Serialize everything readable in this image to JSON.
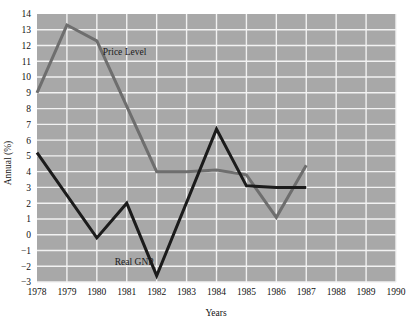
{
  "chart_data": {
    "type": "line",
    "title": "",
    "xlabel": "Years",
    "ylabel": "Annual (%)",
    "grid": true,
    "legend_position": "inline-annotation",
    "x": [
      1978,
      1979,
      1980,
      1981,
      1982,
      1983,
      1984,
      1985,
      1986,
      1987,
      1988,
      1989,
      1990
    ],
    "xlim": [
      1978,
      1990
    ],
    "ylim": [
      -3,
      14
    ],
    "xticks": [
      "1978",
      "1979",
      "1980",
      "1981",
      "1982",
      "1983",
      "1984",
      "1985",
      "1986",
      "1987",
      "1988",
      "1989",
      "1990"
    ],
    "yticks": [
      "14",
      "13",
      "12",
      "11",
      "10",
      "9",
      "8",
      "7",
      "6",
      "5",
      "4",
      "3",
      "2",
      "1",
      "0",
      "-1",
      "-2",
      "-3"
    ],
    "series": [
      {
        "name": "Price Level",
        "color": "#6e6e6e",
        "label_x": 1980.2,
        "label_y": 11.4,
        "x": [
          1978,
          1979,
          1980,
          1982,
          1983,
          1984,
          1985,
          1986,
          1987
        ],
        "values": [
          9.0,
          13.3,
          12.3,
          4.0,
          4.0,
          4.1,
          3.8,
          1.1,
          4.4
        ]
      },
      {
        "name": "Real GNP",
        "color": "#1b1b1b",
        "label_x": 1980.6,
        "label_y": -1.9,
        "x": [
          1978,
          1980,
          1981,
          1982,
          1984,
          1985,
          1986,
          1987
        ],
        "values": [
          5.2,
          -0.2,
          2.0,
          -2.6,
          6.7,
          3.1,
          3.0,
          3.0
        ]
      }
    ]
  },
  "plot": {
    "background_color": "#a8a8a8",
    "gridline_color": "#f2f2f2",
    "page_background": "#ffffff"
  }
}
